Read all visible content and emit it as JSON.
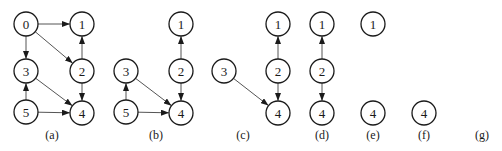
{
  "figure": {
    "node_radius": 12,
    "stroke_color": "#1a1a1a",
    "edge_color": "#555555",
    "panels": [
      {
        "caption": "(a)",
        "caption_x": 52,
        "nodes": [
          {
            "id": "0",
            "x": 26,
            "y": 24
          },
          {
            "id": "1",
            "x": 82,
            "y": 24
          },
          {
            "id": "3",
            "x": 26,
            "y": 71
          },
          {
            "id": "2",
            "x": 82,
            "y": 71
          },
          {
            "id": "5",
            "x": 26,
            "y": 112
          },
          {
            "id": "4",
            "x": 82,
            "y": 113
          }
        ],
        "edges": [
          {
            "from": "0",
            "to": "1"
          },
          {
            "from": "0",
            "to": "3"
          },
          {
            "from": "0",
            "to": "2"
          },
          {
            "from": "2",
            "to": "1"
          },
          {
            "from": "2",
            "to": "4"
          },
          {
            "from": "3",
            "to": "4"
          },
          {
            "from": "5",
            "to": "3"
          },
          {
            "from": "5",
            "to": "4"
          }
        ]
      },
      {
        "caption": "(b)",
        "caption_x": 156,
        "nodes": [
          {
            "id": "1",
            "x": 181,
            "y": 24
          },
          {
            "id": "3",
            "x": 126,
            "y": 71
          },
          {
            "id": "2",
            "x": 181,
            "y": 71
          },
          {
            "id": "5",
            "x": 126,
            "y": 112
          },
          {
            "id": "4",
            "x": 181,
            "y": 113
          }
        ],
        "edges": [
          {
            "from": "2",
            "to": "1"
          },
          {
            "from": "2",
            "to": "4"
          },
          {
            "from": "3",
            "to": "4"
          },
          {
            "from": "5",
            "to": "3"
          },
          {
            "from": "5",
            "to": "4"
          }
        ]
      },
      {
        "caption": "(c)",
        "caption_x": 243,
        "nodes": [
          {
            "id": "1",
            "x": 278,
            "y": 24
          },
          {
            "id": "3",
            "x": 224,
            "y": 71
          },
          {
            "id": "2",
            "x": 278,
            "y": 71
          },
          {
            "id": "4",
            "x": 278,
            "y": 113
          }
        ],
        "edges": [
          {
            "from": "2",
            "to": "1"
          },
          {
            "from": "2",
            "to": "4"
          },
          {
            "from": "3",
            "to": "4"
          }
        ]
      },
      {
        "caption": "(d)",
        "caption_x": 322,
        "nodes": [
          {
            "id": "1",
            "x": 322,
            "y": 24
          },
          {
            "id": "2",
            "x": 322,
            "y": 71
          },
          {
            "id": "4",
            "x": 322,
            "y": 113
          }
        ],
        "edges": [
          {
            "from": "2",
            "to": "1"
          },
          {
            "from": "2",
            "to": "4"
          }
        ]
      },
      {
        "caption": "(e)",
        "caption_x": 373,
        "nodes": [
          {
            "id": "1",
            "x": 373,
            "y": 24
          },
          {
            "id": "4",
            "x": 373,
            "y": 113
          }
        ],
        "edges": []
      },
      {
        "caption": "(f)",
        "caption_x": 424,
        "nodes": [
          {
            "id": "4",
            "x": 424,
            "y": 113
          }
        ],
        "edges": []
      },
      {
        "caption": "(g)",
        "caption_x": 482,
        "nodes": [],
        "edges": []
      }
    ]
  }
}
